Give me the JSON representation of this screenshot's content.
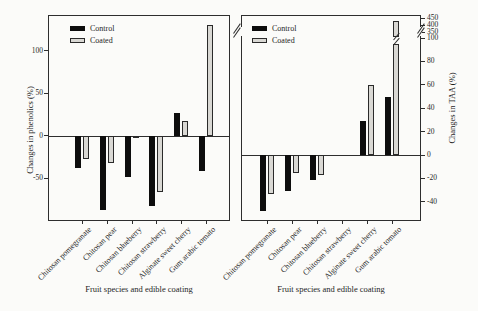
{
  "figure": {
    "background": "#fbfbf9"
  },
  "colors": {
    "control": "#0d0d0d",
    "coated_fill": "#d9d8d4",
    "coated_border": "#2a2a2a",
    "axis": "#2e2e2e",
    "text": "#1f1f1f"
  },
  "legend": {
    "control_label": "Control",
    "coated_label": "Coated"
  },
  "chart_data": [
    {
      "type": "bar",
      "id": "phenolics",
      "title": "",
      "ylabel": "Changes in phenolics (%)",
      "xlabel": "Fruit species and edible coating",
      "categories": [
        "Chitosan pomegranate",
        "Chitosan pear",
        "Chitosan blueberry",
        "Chitosan strawberry",
        "Alginate sweet cherry",
        "Gum arabic tomato"
      ],
      "series": [
        {
          "name": "Control",
          "values": [
            -38,
            -87,
            -49,
            -82,
            27,
            -41
          ]
        },
        {
          "name": "Coated",
          "values": [
            -27,
            -32,
            -3,
            -66,
            17,
            130
          ]
        }
      ],
      "yticks": [
        -50,
        0,
        50,
        100
      ],
      "ylim": [
        -100,
        142
      ],
      "grid": false,
      "legend_position": "top-left"
    },
    {
      "type": "bar",
      "id": "taa",
      "title": "",
      "ylabel": "Changes in TAA (%)",
      "xlabel": "Fruit species and edible coating",
      "categories": [
        "Chitosan pomegranate",
        "Chitosan pear",
        "Chitosan blueberry",
        "Chitosan strawberry",
        "Alginate sweet cherry",
        "Gum arabic tomato"
      ],
      "series": [
        {
          "name": "Control",
          "values": [
            -48,
            -31,
            -21,
            null,
            29,
            50
          ]
        },
        {
          "name": "Coated",
          "values": [
            -33,
            -15,
            -17,
            null,
            60,
            430
          ]
        }
      ],
      "yticks": [
        -40,
        -20,
        0,
        20,
        40,
        60,
        80,
        100
      ],
      "yticks_above_break": [
        350,
        400,
        450
      ],
      "axis_break": {
        "between": [
          100,
          350
        ]
      },
      "ylim": [
        -56,
        460
      ],
      "grid": false,
      "legend_position": "top-left"
    }
  ]
}
